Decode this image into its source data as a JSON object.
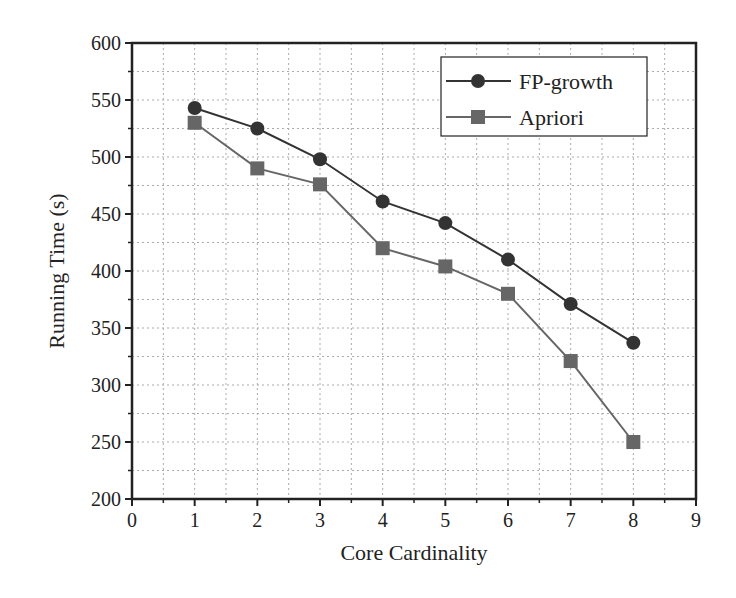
{
  "chart_data": {
    "type": "line",
    "title": "",
    "xlabel": "Core Cardinality",
    "ylabel": "Running Time (s)",
    "xlim": [
      0,
      9
    ],
    "ylim": [
      200,
      600
    ],
    "x_ticks": [
      0,
      1,
      2,
      3,
      4,
      5,
      6,
      7,
      8,
      9
    ],
    "y_ticks": [
      200,
      250,
      300,
      350,
      400,
      450,
      500,
      550,
      600
    ],
    "grid": true,
    "grid_style": "dotted, major and minor",
    "legend_position": "upper right",
    "x": [
      1,
      2,
      3,
      4,
      5,
      6,
      7,
      8
    ],
    "series": [
      {
        "name": "FP-growth",
        "marker": "circle",
        "color": "#333333",
        "values": [
          543,
          525,
          498,
          461,
          442,
          410,
          371,
          337
        ]
      },
      {
        "name": "Apriori",
        "marker": "square",
        "color": "#666666",
        "values": [
          530,
          490,
          476,
          420,
          404,
          380,
          321,
          250
        ]
      }
    ]
  },
  "legend": {
    "items": [
      {
        "label": "FP-growth"
      },
      {
        "label": "Apriori"
      }
    ]
  }
}
